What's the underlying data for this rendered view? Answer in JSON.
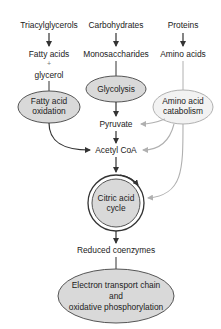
{
  "diagram": {
    "colors": {
      "text": "#222222",
      "dark_arrow": "#333333",
      "light_arrow": "#b0b0b0",
      "node_fill": "#d9d9d9",
      "node_stroke": "#555555"
    },
    "sources": {
      "lipids": "Triacylglycerols",
      "carbs": "Carbohydrates",
      "proteins": "Proteins"
    },
    "products": {
      "fatty_acids": "Fatty acids",
      "plus": "+",
      "glycerol": "glycerol",
      "monosaccharides": "Monosaccharides",
      "amino_acids": "Amino acids"
    },
    "processes": {
      "glycolysis": "Glycolysis",
      "fatty_acid_oxidation_line1": "Fatty acid",
      "fatty_acid_oxidation_line2": "oxidation",
      "amino_acid_catabolism_line1": "Amino acid",
      "amino_acid_catabolism_line2": "catabolism"
    },
    "intermediates": {
      "pyruvate": "Pyruvate",
      "acetyl_coa": "Acetyl CoA"
    },
    "citric_acid_cycle": {
      "line1": "Citric acid",
      "line2": "cycle"
    },
    "reduced_coenzymes": "Reduced coenzymes",
    "etc": {
      "line1": "Electron transport chain",
      "line2": "and",
      "line3": "oxidative phosphorylation"
    }
  }
}
